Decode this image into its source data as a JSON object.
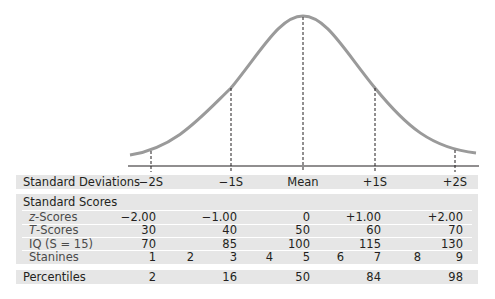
{
  "diagram": {
    "type": "normal_distribution_scale_comparison",
    "curve": {
      "color": "#9a9a9a",
      "peak_label": "Mean",
      "markers": [
        "-2S",
        "-1S",
        "Mean",
        "+1S",
        "+2S"
      ]
    },
    "band_color": "#e6e6e6",
    "rows": {
      "standard_deviations": {
        "label": "Standard Deviations",
        "values": [
          "−2S",
          "−1S",
          "Mean",
          "+1S",
          "+2S"
        ]
      },
      "standard_scores": {
        "label": "Standard Scores",
        "z_scores": {
          "label_italic": "z",
          "label_rest": "-Scores",
          "values": [
            "−2.00",
            "−1.00",
            "0",
            "+1.00",
            "+2.00"
          ]
        },
        "t_scores": {
          "label_italic": "T",
          "label_rest": "-Scores",
          "values": [
            "30",
            "40",
            "50",
            "60",
            "70"
          ]
        },
        "iq": {
          "label": "IQ (S = 15)",
          "values": [
            "70",
            "85",
            "100",
            "115",
            "130"
          ]
        },
        "stanines": {
          "label": "Stanines",
          "values": [
            "1",
            "2",
            "3",
            "4",
            "5",
            "6",
            "7",
            "8",
            "9"
          ]
        }
      },
      "percentiles": {
        "label": "Percentiles",
        "values": [
          "2",
          "16",
          "50",
          "84",
          "98"
        ]
      }
    }
  }
}
